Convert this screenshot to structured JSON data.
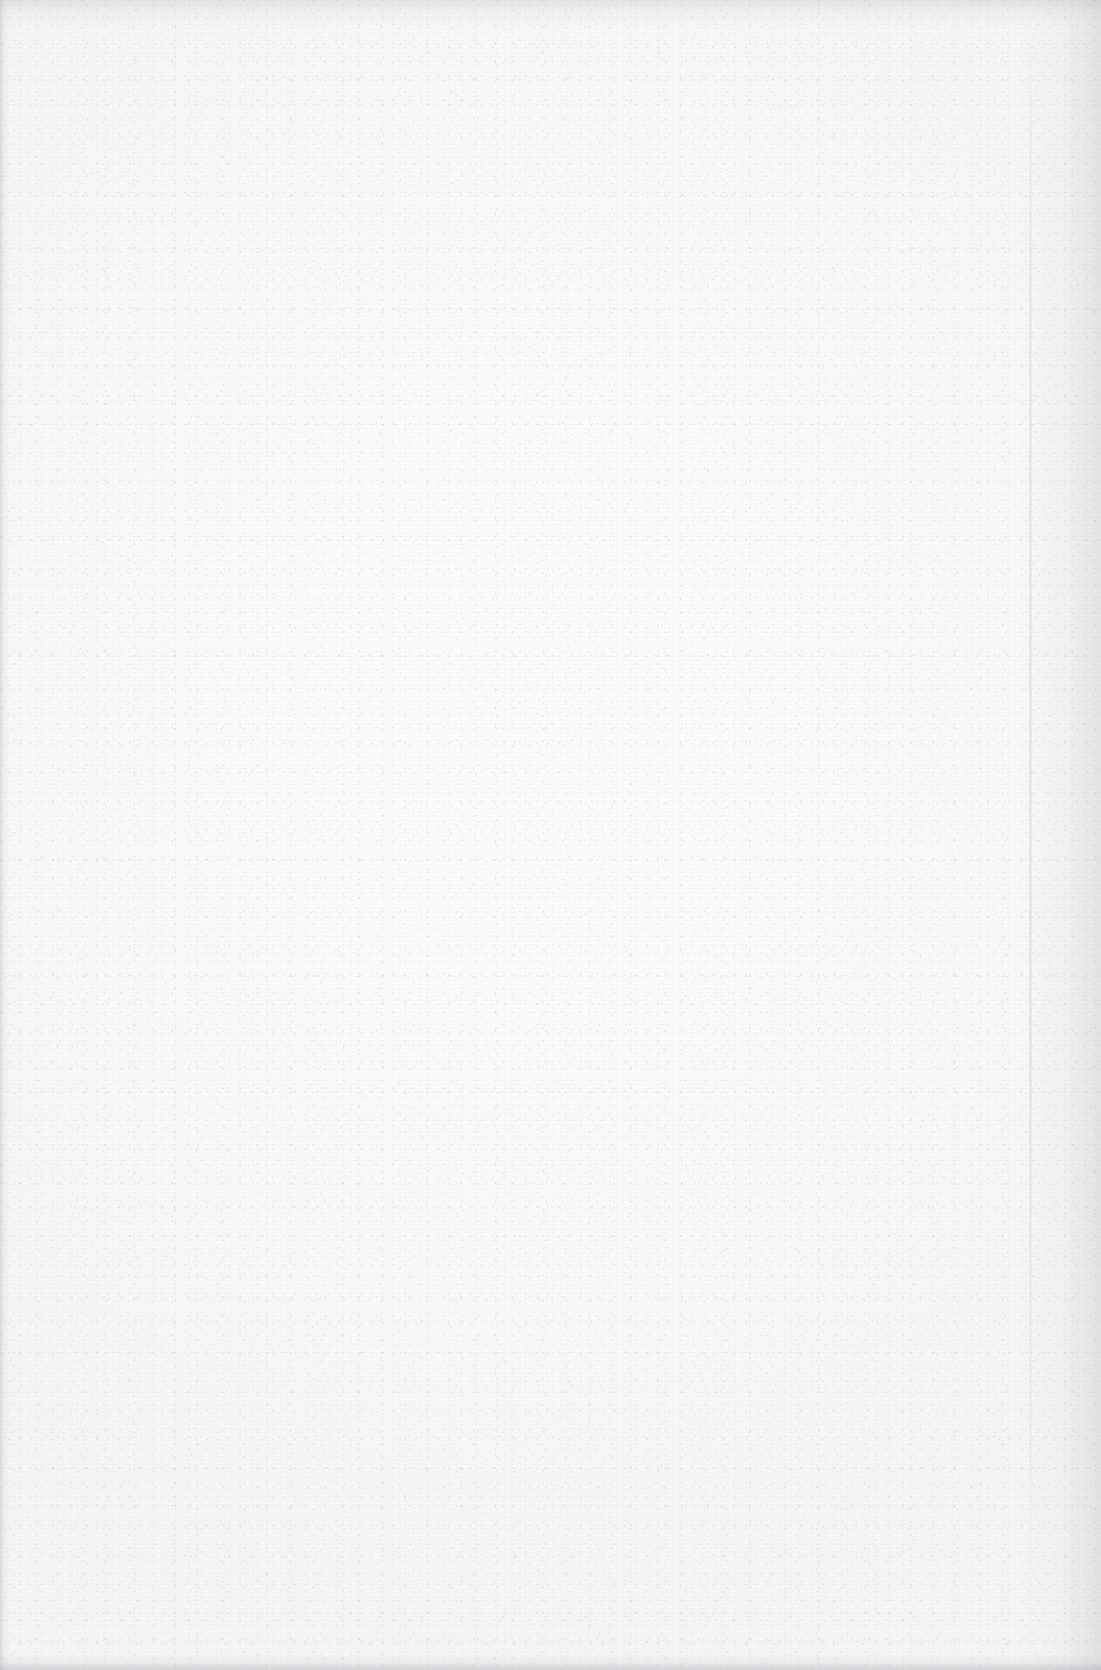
{
  "document": {
    "kind": "scanned-page",
    "content_text": "",
    "visible_text_items": [],
    "page_number_label": "",
    "header_text": "",
    "footer_text": "",
    "is_blank": "blank"
  },
  "canvas": {
    "width_px": 1101,
    "height_px": 1670
  },
  "appearance": {
    "paper_base_color": "#f8f8f8",
    "paper_highlight_color": "#fbfbfb",
    "paper_shade_color": "#f5f5f5",
    "grain_color": "#94969c",
    "edge_shadow_color": "#787c82"
  },
  "edges": {
    "left_shadow_label": "left-scan-edge-shadow",
    "right_shadow_label": "right-scan-edge-shadow",
    "top_shadow_label": "top-scan-edge-shadow",
    "bottom_shadow_label": "bottom-scan-edge-shadow",
    "right_streak_label": "right-vertical-scan-streak"
  }
}
